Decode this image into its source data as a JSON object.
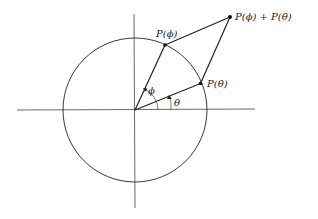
{
  "diagram": {
    "type": "unit-circle-vector-addition",
    "labels": {
      "p_phi": "P(ϕ)",
      "p_theta": "P(θ)",
      "p_sum": "P(ϕ) + P(θ)",
      "angle_phi": "ϕ",
      "angle_theta": "θ"
    },
    "colors": {
      "stroke": "#222222",
      "axis": "#444444",
      "background": "#ffffff"
    }
  }
}
